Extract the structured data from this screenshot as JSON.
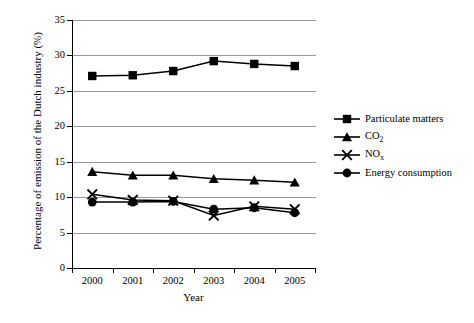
{
  "chart_data": {
    "type": "line",
    "title": "",
    "xlabel": "Year",
    "ylabel": "Percentage of emission of the Dutch industry (%)",
    "categories": [
      "2000",
      "2001",
      "2002",
      "2003",
      "2004",
      "2005"
    ],
    "x": [
      2000,
      2001,
      2002,
      2003,
      2004,
      2005
    ],
    "ylim": [
      0,
      35
    ],
    "ytick_step": 5,
    "yticks": [
      "0",
      "5",
      "10",
      "15",
      "20",
      "25",
      "30",
      "35"
    ],
    "grid": "horizontal",
    "legend_position": "right",
    "series": [
      {
        "name": "Particulate matters",
        "marker": "filled-square",
        "values": [
          27.1,
          27.2,
          27.8,
          29.2,
          28.8,
          28.5
        ]
      },
      {
        "name": "CO2",
        "name_html": "CO<sub>2</sub>",
        "marker": "filled-triangle",
        "values": [
          13.6,
          13.1,
          13.1,
          12.6,
          12.4,
          12.1
        ]
      },
      {
        "name": "NOx",
        "name_html": "NO<sub>x</sub>",
        "marker": "cross-x",
        "values": [
          10.4,
          9.6,
          9.5,
          7.4,
          8.7,
          8.3
        ]
      },
      {
        "name": "Energy consumption",
        "marker": "filled-circle",
        "values": [
          9.3,
          9.3,
          9.4,
          8.3,
          8.5,
          7.8
        ]
      }
    ]
  },
  "legend": {
    "items": [
      {
        "label": "Particulate matters",
        "marker": "filled-square"
      },
      {
        "label": "CO2",
        "marker": "filled-triangle"
      },
      {
        "label": "NOx",
        "marker": "cross-x"
      },
      {
        "label": "Energy consumption",
        "marker": "filled-circle"
      }
    ]
  },
  "colors": {
    "series": "#000000",
    "grid": "#8f8f8f",
    "axis": "#000000",
    "background": "#ffffff"
  }
}
